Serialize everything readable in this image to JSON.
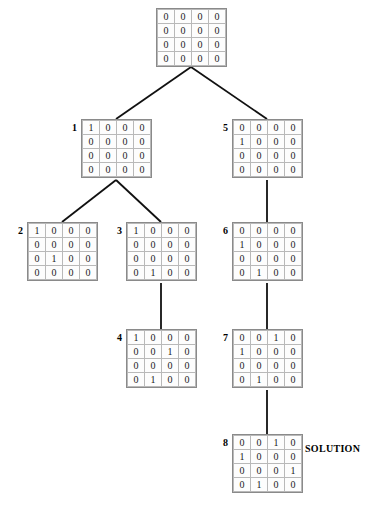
{
  "diagram": {
    "solution_label": "SOLUTION",
    "cell_zero": "0",
    "cell_one": "1"
  },
  "nodes": [
    {
      "id": "root",
      "label": "",
      "x": 156,
      "y": 8,
      "rows": [
        [
          "0",
          "0",
          "0",
          "0"
        ],
        [
          "0",
          "0",
          "0",
          "0"
        ],
        [
          "0",
          "0",
          "0",
          "0"
        ],
        [
          "0",
          "0",
          "0",
          "0"
        ]
      ]
    },
    {
      "id": "n1",
      "label": "1",
      "x": 81,
      "y": 119,
      "rows": [
        [
          "1",
          "0",
          "0",
          "0"
        ],
        [
          "0",
          "0",
          "0",
          "0"
        ],
        [
          "0",
          "0",
          "0",
          "0"
        ],
        [
          "0",
          "0",
          "0",
          "0"
        ]
      ]
    },
    {
      "id": "n5",
      "label": "5",
      "x": 232,
      "y": 119,
      "rows": [
        [
          "0",
          "0",
          "0",
          "0"
        ],
        [
          "1",
          "0",
          "0",
          "0"
        ],
        [
          "0",
          "0",
          "0",
          "0"
        ],
        [
          "0",
          "0",
          "0",
          "0"
        ]
      ]
    },
    {
      "id": "n2",
      "label": "2",
      "x": 27,
      "y": 222,
      "rows": [
        [
          "1",
          "0",
          "0",
          "0"
        ],
        [
          "0",
          "0",
          "0",
          "0"
        ],
        [
          "0",
          "1",
          "0",
          "0"
        ],
        [
          "0",
          "0",
          "0",
          "0"
        ]
      ]
    },
    {
      "id": "n3",
      "label": "3",
      "x": 126,
      "y": 222,
      "rows": [
        [
          "1",
          "0",
          "0",
          "0"
        ],
        [
          "0",
          "0",
          "0",
          "0"
        ],
        [
          "0",
          "0",
          "0",
          "0"
        ],
        [
          "0",
          "1",
          "0",
          "0"
        ]
      ]
    },
    {
      "id": "n6",
      "label": "6",
      "x": 232,
      "y": 222,
      "rows": [
        [
          "0",
          "0",
          "0",
          "0"
        ],
        [
          "1",
          "0",
          "0",
          "0"
        ],
        [
          "0",
          "0",
          "0",
          "0"
        ],
        [
          "0",
          "1",
          "0",
          "0"
        ]
      ]
    },
    {
      "id": "n4",
      "label": "4",
      "x": 126,
      "y": 329,
      "rows": [
        [
          "1",
          "0",
          "0",
          "0"
        ],
        [
          "0",
          "0",
          "1",
          "0"
        ],
        [
          "0",
          "0",
          "0",
          "0"
        ],
        [
          "0",
          "1",
          "0",
          "0"
        ]
      ]
    },
    {
      "id": "n7",
      "label": "7",
      "x": 232,
      "y": 329,
      "rows": [
        [
          "0",
          "0",
          "1",
          "0"
        ],
        [
          "1",
          "0",
          "0",
          "0"
        ],
        [
          "0",
          "0",
          "0",
          "0"
        ],
        [
          "0",
          "1",
          "0",
          "0"
        ]
      ]
    },
    {
      "id": "n8",
      "label": "8",
      "x": 232,
      "y": 434,
      "rows": [
        [
          "0",
          "0",
          "1",
          "0"
        ],
        [
          "1",
          "0",
          "0",
          "0"
        ],
        [
          "0",
          "0",
          "0",
          "1"
        ],
        [
          "0",
          "1",
          "0",
          "0"
        ]
      ]
    }
  ],
  "edges": [
    {
      "name": "root-to-1",
      "x1": 191,
      "y1": 67,
      "x2": 116,
      "y2": 119
    },
    {
      "name": "root-to-5",
      "x1": 191,
      "y1": 67,
      "x2": 267,
      "y2": 119
    },
    {
      "name": "n1-to-2",
      "x1": 116,
      "y1": 180,
      "x2": 62,
      "y2": 222
    },
    {
      "name": "n1-to-3",
      "x1": 116,
      "y1": 180,
      "x2": 161,
      "y2": 222
    },
    {
      "name": "n3-to-4",
      "x1": 161,
      "y1": 283,
      "x2": 161,
      "y2": 329
    },
    {
      "name": "n5-to-6",
      "x1": 267,
      "y1": 180,
      "x2": 267,
      "y2": 222
    },
    {
      "name": "n6-to-7",
      "x1": 267,
      "y1": 283,
      "x2": 267,
      "y2": 329
    },
    {
      "name": "n7-to-8",
      "x1": 267,
      "y1": 390,
      "x2": 267,
      "y2": 434
    }
  ],
  "annotations": [
    {
      "name": "solution-label",
      "text": "SOLUTION",
      "x": 305,
      "y": 443
    }
  ],
  "colors": {
    "grid_outer_border": "#8a8a8a",
    "grid_cell_border": "#b9b9b9",
    "edge_stroke": "#111111",
    "text": "#1a1a1a",
    "background": "#ffffff"
  }
}
